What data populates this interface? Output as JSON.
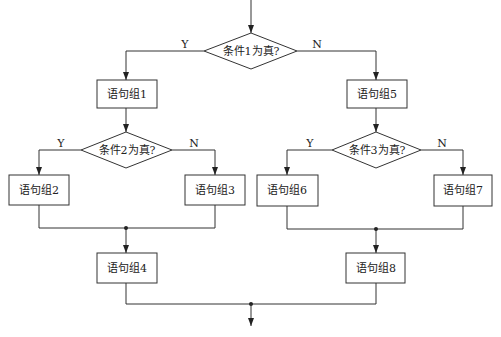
{
  "flowchart": {
    "decisions": [
      {
        "id": "d1",
        "label": "条件1为真?",
        "yes": "Y",
        "no": "N"
      },
      {
        "id": "d2",
        "label": "条件2为真?",
        "yes": "Y",
        "no": "N"
      },
      {
        "id": "d3",
        "label": "条件3为真?",
        "yes": "Y",
        "no": "N"
      }
    ],
    "processes": [
      {
        "id": "p1",
        "label": "语句组1"
      },
      {
        "id": "p2",
        "label": "语句组2"
      },
      {
        "id": "p3",
        "label": "语句组3"
      },
      {
        "id": "p4",
        "label": "语句组4"
      },
      {
        "id": "p5",
        "label": "语句组5"
      },
      {
        "id": "p6",
        "label": "语句组6"
      },
      {
        "id": "p7",
        "label": "语句组7"
      },
      {
        "id": "p8",
        "label": "语句组8"
      }
    ],
    "colors": {
      "stroke": "#333333",
      "fill": "#ffffff",
      "text": "#222222"
    }
  }
}
